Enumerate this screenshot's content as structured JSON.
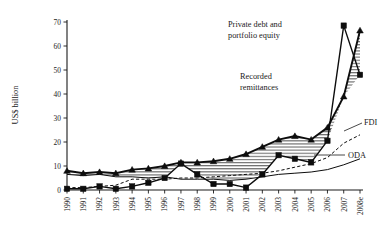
{
  "chart_data": {
    "type": "line",
    "title": "",
    "xlabel": "",
    "ylabel": "US$ billion",
    "ylim": [
      0,
      70
    ],
    "yticks": [
      0,
      10,
      20,
      30,
      40,
      50,
      60,
      70
    ],
    "grid": false,
    "legend_position": "inline-annotations",
    "x": [
      "1990",
      "1991",
      "1992",
      "1993",
      "1994",
      "1995",
      "1996",
      "1997",
      "1998",
      "1999",
      "2000",
      "2001",
      "2002",
      "2003",
      "2004",
      "2005",
      "2006",
      "2007",
      "2008e"
    ],
    "series": [
      {
        "name": "Recorded remittances",
        "marker": "triangle",
        "style": "solid-thick",
        "values": [
          8.0,
          7.0,
          7.5,
          7.0,
          8.5,
          9.0,
          10.0,
          11.5,
          11.5,
          12.0,
          13.0,
          15.0,
          18.0,
          21.0,
          22.5,
          21.0,
          26.0,
          39.0,
          66.5
        ]
      },
      {
        "name": "Private debt and portfolio equity",
        "marker": "square",
        "style": "solid-mid",
        "values": [
          0.5,
          0.5,
          1.5,
          0.5,
          1.5,
          3.0,
          5.0,
          11.0,
          6.5,
          2.5,
          2.5,
          1.0,
          6.5,
          14.5,
          13.0,
          11.5,
          20.5,
          68.5,
          48.0
        ]
      },
      {
        "name": "FDI",
        "marker": "none",
        "style": "dashed-thin",
        "values": [
          1.0,
          1.0,
          1.5,
          2.0,
          4.5,
          4.5,
          4.5,
          5.0,
          5.0,
          5.5,
          6.0,
          6.5,
          7.0,
          8.0,
          9.5,
          11.0,
          13.5,
          19.5,
          23.0
        ]
      },
      {
        "name": "ODA",
        "marker": "none",
        "style": "solid-thin",
        "values": [
          6.5,
          6.0,
          6.5,
          5.5,
          5.5,
          5.0,
          5.5,
          4.5,
          4.5,
          4.5,
          4.0,
          4.5,
          5.5,
          6.5,
          7.0,
          7.5,
          8.5,
          10.5,
          13.0
        ]
      }
    ],
    "annotations": [
      {
        "text": "Private debt and portfolio equity",
        "name": "private-debt-label"
      },
      {
        "text": "Recorded remittances",
        "name": "recorded-remittances-label"
      },
      {
        "text": "FDI",
        "name": "fdi-label"
      },
      {
        "text": "ODA",
        "name": "oda-label"
      }
    ]
  },
  "annotation_text": {
    "private_debt_line1": "Private debt and",
    "private_debt_line2": "portfolio equity",
    "remittances_line1": "Recorded",
    "remittances_line2": "remittances",
    "fdi": "FDI",
    "oda": "ODA"
  },
  "colors": {
    "ink": "#0d0d0d",
    "background": "#ffffff"
  }
}
